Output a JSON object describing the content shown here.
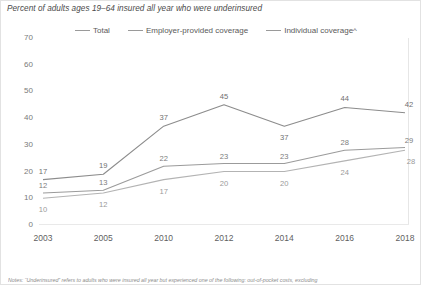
{
  "chart_data": {
    "type": "line",
    "title": "Percent of adults ages 19–64 insured all year who were underinsured",
    "xlabel": "",
    "ylabel": "",
    "ylim": [
      0,
      70
    ],
    "yticks": [
      0,
      10,
      20,
      30,
      40,
      50,
      60,
      70
    ],
    "grid": false,
    "legend_position": "top",
    "categories": [
      "2003",
      "2005",
      "2010",
      "2012",
      "2014",
      "2016",
      "2018"
    ],
    "series": [
      {
        "name": "Total",
        "values": [
          17,
          19,
          37,
          45,
          37,
          44,
          42
        ],
        "color": "#8c8c8c"
      },
      {
        "name": "Employer-provided coverage",
        "values": [
          12,
          13,
          22,
          23,
          23,
          28,
          29
        ],
        "color": "#9b9b9b"
      },
      {
        "name": "Individual coverage^",
        "values": [
          10,
          12,
          17,
          20,
          20,
          24,
          28
        ],
        "color": "#b3b3b3"
      }
    ],
    "note": "Notes: “Underinsured” refers to adults who were insured all year but experienced one of the following: out-of-pocket costs, excluding"
  },
  "legend": {
    "items": [
      {
        "label": "Total"
      },
      {
        "label": "Employer-provided coverage"
      },
      {
        "label": "Individual coverage^"
      }
    ]
  }
}
